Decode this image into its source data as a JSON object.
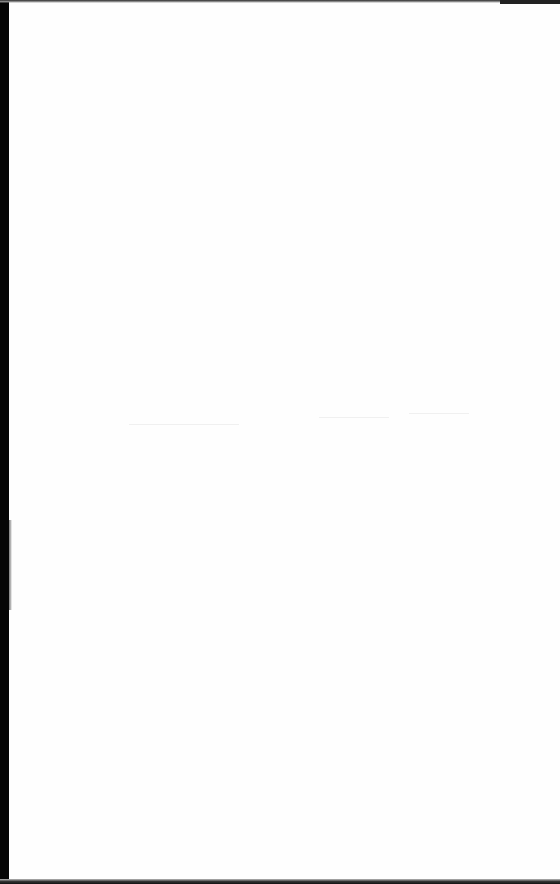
{
  "document": {
    "type": "scanned-page",
    "content": "blank",
    "background_color": "#ffffff",
    "scanner_edge_color": "#050505",
    "visible_text": []
  }
}
